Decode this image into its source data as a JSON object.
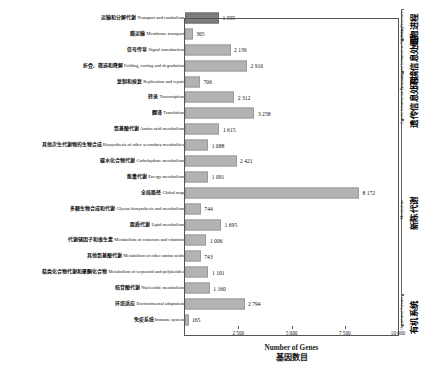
{
  "chart_data": {
    "type": "bar",
    "orientation": "horizontal",
    "title": "",
    "xlabel_en": "Number of Genes",
    "xlabel_zh": "基因数目",
    "ylabel": "",
    "xlim": [
      0,
      10000
    ],
    "xticks": [
      2500,
      5000,
      7500,
      10000
    ],
    "xtick_labels": [
      "2 500",
      "5 000",
      "7 500",
      "10 000"
    ],
    "grid": false,
    "legend": "none",
    "categories": [
      "运输和分解代谢 Transport and catabolism",
      "膜运输 Membrane transport",
      "信号传导 Signal transduction",
      "折叠、筛选和降解 Folding, sorting and degradation",
      "复制和修复 Replication and repair",
      "转录 Transcription",
      "翻译 Translation",
      "氨基酸代谢 Amino acid metabolism",
      "其他次生代谢物的生物合成 Biosynthesis of other secondary metabolites",
      "碳水化合物代谢 Carbohydrate metabolism",
      "能量代谢 Energy metabolism",
      "全局路径 Global map",
      "多糖生物合成和代谢 Glycan biosynthesis and metabolism",
      "脂质代谢 Lipid metabolism",
      "代谢辅因子和维生素 Metabolism of cofactors and vitamins",
      "其他氨基酸代谢 Metabolism of other amino acids",
      "萜类化合物代谢和聚酮化合物 Metabolism of terpenoid and polyketides",
      "核苷酸代谢 Nucleotide metabolism",
      "环境适应 Environmental adaptation",
      "免疫系统 Immune system"
    ],
    "values": [
      1595,
      365,
      2139,
      2910,
      706,
      2312,
      3258,
      1615,
      1088,
      2421,
      1091,
      8172,
      744,
      1695,
      1006,
      743,
      1101,
      1160,
      2794,
      165
    ],
    "value_labels": [
      "1 595",
      "365",
      "2 139",
      "2 910",
      "706",
      "2 312",
      "3 258",
      "1 615",
      "1 088",
      "2 421",
      "1 091",
      "8 172",
      "744",
      "1 695",
      "1 006",
      "743",
      "1 101",
      "1 160",
      "2 794",
      "165"
    ],
    "bar_colors": [
      "#7d7d7d",
      "#b3b3b3",
      "#b3b3b3",
      "#b3b3b3",
      "#b3b3b3",
      "#b3b3b3",
      "#b3b3b3",
      "#b3b3b3",
      "#b3b3b3",
      "#b3b3b3",
      "#b3b3b3",
      "#b3b3b3",
      "#b3b3b3",
      "#b3b3b3",
      "#b3b3b3",
      "#b3b3b3",
      "#b3b3b3",
      "#b3b3b3",
      "#b3b3b3",
      "#b3b3b3"
    ]
  },
  "rows": [
    {
      "zh": "运输和分解代谢 ",
      "en": "Transport and catabolism",
      "value": 1595,
      "label": "1 595",
      "dark": true
    },
    {
      "zh": "膜运输 ",
      "en": "Membrane transport",
      "value": 365,
      "label": "365",
      "dark": false
    },
    {
      "zh": "信号传导 ",
      "en": "Signal transduction",
      "value": 2139,
      "label": "2 139",
      "dark": false
    },
    {
      "zh": "折叠、筛选和降解 ",
      "en": "Folding, sorting and degradation",
      "value": 2910,
      "label": "2 910",
      "dark": false
    },
    {
      "zh": "复制和修复 ",
      "en": "Replication and repair",
      "value": 706,
      "label": "706",
      "dark": false
    },
    {
      "zh": "转录 ",
      "en": "Transcription",
      "value": 2312,
      "label": "2 312",
      "dark": false
    },
    {
      "zh": "翻译 ",
      "en": "Translation",
      "value": 3258,
      "label": "3 258",
      "dark": false
    },
    {
      "zh": "氨基酸代谢 ",
      "en": "Amino acid metabolism",
      "value": 1615,
      "label": "1 615",
      "dark": false
    },
    {
      "zh": "其他次生代谢物的生物合成 ",
      "en": "Biosynthesis of other secondary metabolites",
      "value": 1088,
      "label": "1 088",
      "dark": false
    },
    {
      "zh": "碳水化合物代谢 ",
      "en": "Carbohydrate metabolism",
      "value": 2421,
      "label": "2 421",
      "dark": false
    },
    {
      "zh": "能量代谢 ",
      "en": "Energy metabolism",
      "value": 1091,
      "label": "1 091",
      "dark": false
    },
    {
      "zh": "全局路径 ",
      "en": "Global map",
      "value": 8172,
      "label": "8 172",
      "dark": false
    },
    {
      "zh": "多糖生物合成和代谢 ",
      "en": "Glycan biosynthesis and metabolism",
      "value": 744,
      "label": "744",
      "dark": false
    },
    {
      "zh": "脂质代谢 ",
      "en": "Lipid metabolism",
      "value": 1695,
      "label": "1 695",
      "dark": false
    },
    {
      "zh": "代谢辅因子和维生素 ",
      "en": "Metabolism of cofactors and vitamins",
      "value": 1006,
      "label": "1 006",
      "dark": false
    },
    {
      "zh": "其他氨基酸代谢 ",
      "en": "Metabolism of other amino acids",
      "value": 743,
      "label": "743",
      "dark": false
    },
    {
      "zh": "萜类化合物代谢和聚酮化合物 ",
      "en": "Metabolism of terpenoid and polyketides",
      "value": 1101,
      "label": "1 101",
      "dark": false
    },
    {
      "zh": "核苷酸代谢 ",
      "en": "Nucleotide metabolism",
      "value": 1160,
      "label": "1 160",
      "dark": false
    },
    {
      "zh": "环境适应 ",
      "en": "Environmental adaptation",
      "value": 2794,
      "label": "2 794",
      "dark": false
    },
    {
      "zh": "免疫系统 ",
      "en": "Immune system",
      "value": 165,
      "label": "165",
      "dark": false
    }
  ],
  "xaxis": {
    "ticks": [
      "2 500",
      "5 000",
      "7 500",
      "10 000"
    ],
    "title_en": "Number of Genes",
    "title_zh": "基因数目"
  },
  "groups": [
    {
      "zh": "细胞进程",
      "en": "Cellular Processes",
      "start_row": 0,
      "end_row": 1
    },
    {
      "zh": "环境信息处理",
      "en": "Environmental Information Processing",
      "start_row": 2,
      "end_row": 3
    },
    {
      "zh": "遗传信息处理",
      "en": "Genetic Information Processing",
      "start_row": 4,
      "end_row": 6
    },
    {
      "zh": "新陈代谢",
      "en": "Metabolism",
      "start_row": 7,
      "end_row": 17
    },
    {
      "zh": "有机系统",
      "en": "Organismal Persons",
      "start_row": 18,
      "end_row": 19
    }
  ]
}
